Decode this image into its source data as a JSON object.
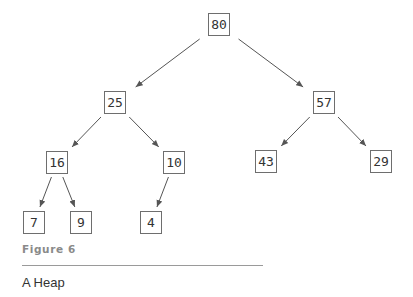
{
  "figure": {
    "label": "Figure 6",
    "caption": "A Heap"
  },
  "tree": {
    "nodes": [
      {
        "id": "n80",
        "value": "80",
        "x": 208,
        "y": 13
      },
      {
        "id": "n25",
        "value": "25",
        "x": 104,
        "y": 91
      },
      {
        "id": "n57",
        "value": "57",
        "x": 313,
        "y": 91
      },
      {
        "id": "n16",
        "value": "16",
        "x": 46,
        "y": 151
      },
      {
        "id": "n10",
        "value": "10",
        "x": 163,
        "y": 151
      },
      {
        "id": "n43",
        "value": "43",
        "x": 255,
        "y": 150
      },
      {
        "id": "n29",
        "value": "29",
        "x": 370,
        "y": 150
      },
      {
        "id": "n7",
        "value": "7",
        "x": 23,
        "y": 211
      },
      {
        "id": "n9",
        "value": "9",
        "x": 70,
        "y": 211
      },
      {
        "id": "n4",
        "value": "4",
        "x": 140,
        "y": 211
      }
    ],
    "edges": [
      {
        "from": "n80",
        "to": "n25"
      },
      {
        "from": "n80",
        "to": "n57"
      },
      {
        "from": "n25",
        "to": "n16"
      },
      {
        "from": "n25",
        "to": "n10"
      },
      {
        "from": "n57",
        "to": "n43"
      },
      {
        "from": "n57",
        "to": "n29"
      },
      {
        "from": "n16",
        "to": "n7"
      },
      {
        "from": "n16",
        "to": "n9"
      },
      {
        "from": "n10",
        "to": "n4"
      }
    ]
  },
  "colors": {
    "edge": "#555555",
    "node_border": "#6e6e6e"
  }
}
